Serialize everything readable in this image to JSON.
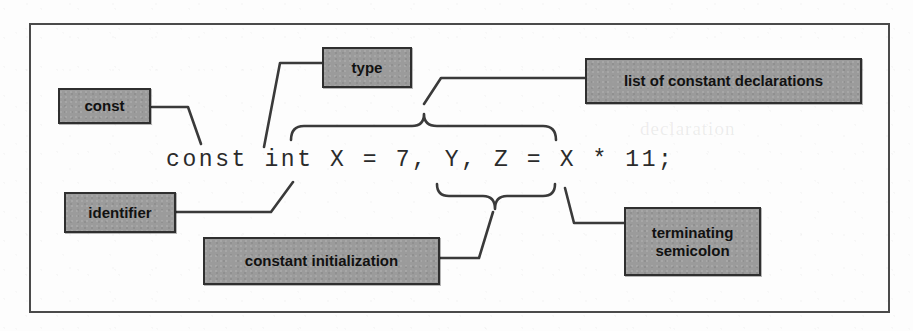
{
  "figure": {
    "frame_color": "#4a4a4a",
    "box_fill": "#9b9b9b",
    "box_border": "#2f2f2f",
    "line_color": "#3a3a3a",
    "code": "const int X = 7, Y, Z = X * 11;"
  },
  "ghost_text": {
    "line1": "constants",
    "line2": "declaration"
  },
  "callouts": [
    {
      "id": "const",
      "label": "const",
      "line2": ""
    },
    {
      "id": "type",
      "label": "type",
      "line2": ""
    },
    {
      "id": "list",
      "label": "list of constant declarations",
      "line2": ""
    },
    {
      "id": "identifier",
      "label": "identifier",
      "line2": ""
    },
    {
      "id": "initialization",
      "label": "constant initialization",
      "line2": ""
    },
    {
      "id": "semicolon",
      "label": "terminating",
      "line2": "semicolon"
    }
  ]
}
